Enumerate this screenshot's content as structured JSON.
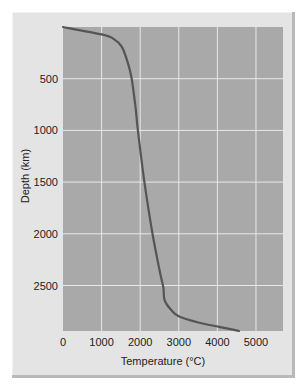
{
  "chart_data": {
    "type": "line",
    "title": "",
    "xlabel": "Temperature (°C)",
    "ylabel": "Depth (km)",
    "xlim": [
      0,
      5700
    ],
    "ylim": [
      2940,
      0
    ],
    "y_inverted": true,
    "grid": true,
    "legend": "none",
    "xticks": [
      0,
      1000,
      2000,
      3000,
      4000,
      5000
    ],
    "xtick_labels": [
      "0",
      "1000",
      "2000",
      "3000",
      "4000",
      "5000"
    ],
    "yticks": [
      500,
      1000,
      1500,
      2000,
      2500
    ],
    "ytick_labels": [
      "500",
      "1000",
      "1500",
      "2000",
      "2500"
    ],
    "series": [
      {
        "name": "Geotherm",
        "color": "#555555",
        "x": [
          0,
          1000,
          1290,
          1520,
          1675,
          1780,
          1880,
          1940,
          2110,
          2320,
          2500,
          2600,
          2630,
          2810,
          3010,
          3530,
          4050,
          4560
        ],
        "y": [
          0,
          72,
          110,
          190,
          340,
          500,
          780,
          1000,
          1500,
          2000,
          2350,
          2520,
          2640,
          2740,
          2800,
          2860,
          2900,
          2940
        ]
      }
    ]
  },
  "colors": {
    "plot_bg": "#a9a9a9",
    "panel_bg": "#e4e4e4",
    "grid": "#e8e8e8",
    "curve": "#555555"
  }
}
